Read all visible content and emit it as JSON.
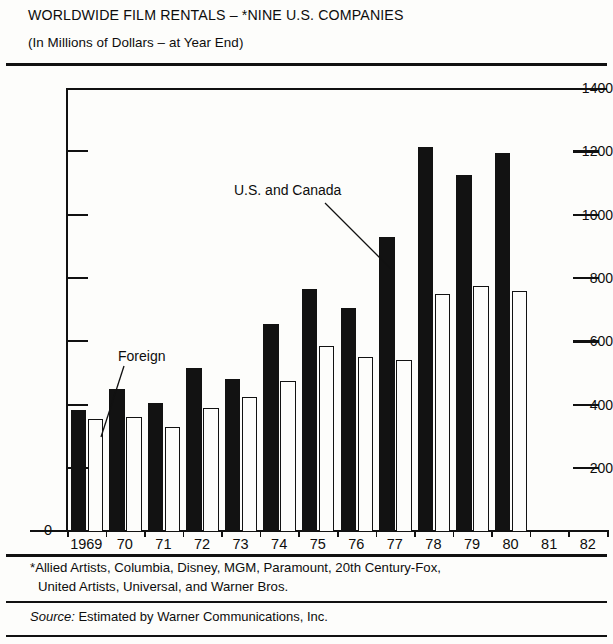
{
  "header": {
    "title": "WORLDWIDE FILM RENTALS – *NINE U.S. COMPANIES",
    "subtitle": "(In Millions of Dollars – at Year End)"
  },
  "footnotes": {
    "line1": "*Allied Artists, Columbia, Disney, MGM, Paramount, 20th Century-Fox,",
    "line2": "United Artists, Universal, and Warner Bros.",
    "source_label": "Source:",
    "source_text": "Estimated by Warner Communications, Inc."
  },
  "annotations": {
    "us_canada": "U.S. and Canada",
    "foreign": "Foreign"
  },
  "colors": {
    "us_canada_bar": "#121212",
    "foreign_bar": "#fdfdfb",
    "axis": "#111111",
    "background": "#fdfdfb"
  },
  "chart_data": {
    "type": "bar",
    "title": "WORLDWIDE FILM RENTALS – *NINE U.S. COMPANIES",
    "subtitle": "(In Millions of Dollars – at Year End)",
    "xlabel": "",
    "ylabel": "",
    "ylim": [
      0,
      1400
    ],
    "ytick_labels": [
      "0",
      "200",
      "400",
      "600",
      "800",
      "1000",
      "1200",
      "1400"
    ],
    "ytick_values": [
      0,
      200,
      400,
      600,
      800,
      1000,
      1200,
      1400
    ],
    "grid": false,
    "legend_position": "annotated-leader-lines",
    "categories": [
      "1969",
      "70",
      "71",
      "72",
      "73",
      "74",
      "75",
      "76",
      "77",
      "78",
      "79",
      "80",
      "81",
      "82"
    ],
    "series": [
      {
        "name": "U.S. and Canada",
        "values": [
          385,
          450,
          405,
          515,
          480,
          655,
          765,
          705,
          930,
          1215,
          1125,
          1195,
          null,
          null
        ]
      },
      {
        "name": "Foreign",
        "values": [
          355,
          360,
          330,
          390,
          425,
          475,
          585,
          550,
          540,
          750,
          775,
          760,
          null,
          null
        ]
      }
    ]
  }
}
